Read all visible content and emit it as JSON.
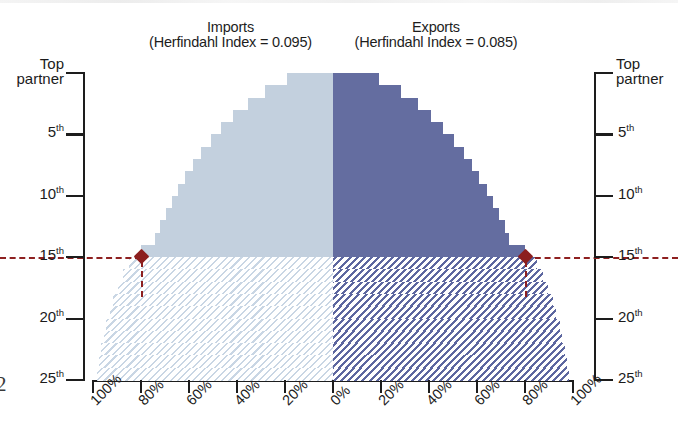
{
  "titles": {
    "imports_line1": "Imports",
    "imports_line2": "(Herfindahl Index = 0.095)",
    "exports_line1": "Exports",
    "exports_line2": "(Herfindahl Index = 0.085)"
  },
  "edge_artifact": "2",
  "axes": {
    "y_left_top_label_line1": "Top",
    "y_left_top_label_line2": "partner",
    "y_right_top_label_line1": "Top",
    "y_right_top_label_line2": "partner",
    "y_ticks": [
      {
        "label": "Top partner",
        "rank": 1
      },
      {
        "label": "5",
        "suffix": "th",
        "rank": 5
      },
      {
        "label": "10",
        "suffix": "th",
        "rank": 10
      },
      {
        "label": "15",
        "suffix": "th",
        "rank": 15
      },
      {
        "label": "20",
        "suffix": "th",
        "rank": 20
      },
      {
        "label": "25",
        "suffix": "th",
        "rank": 25
      }
    ],
    "x_left_ticks": [
      "100%",
      "80%",
      "60%",
      "40%",
      "20%",
      "0%"
    ],
    "x_right_ticks": [
      "0%",
      "20%",
      "40%",
      "60%",
      "80%",
      "100%"
    ]
  },
  "annotation": {
    "reference_rank": 15,
    "imports_cumulative_at_reference": "80%",
    "exports_cumulative_at_reference": "80%",
    "marker_color": "#8c1f1f"
  },
  "colors": {
    "imports_solid": "#c3d0de",
    "imports_hatch": "#c9d6e4",
    "exports_solid": "#646da0",
    "exports_hatch": "#5d67a0",
    "axis": "#1d1d1d",
    "background": "#ffffff"
  },
  "chart_data": {
    "type": "bar",
    "title": "",
    "subtitle": "",
    "orientation": "horizontal-back-to-back",
    "xlabel": "",
    "ylabel": "",
    "xlim": [
      -100,
      100
    ],
    "x_unit": "percent cumulative share",
    "grid": false,
    "legend_position": "top",
    "note": "Back-to-back cumulative trade-share chart. Left axis = imports (cumulative % read right-to-left from 0% at centre to 100% at far left); right axis = exports (cumulative % read left-to-right from 0% at centre to 100% at far right). Rows are trading-partner ranks 1 (Top partner) through 25. Rows 1-15 are drawn solid, rows 16-25 are drawn hatched (below the 15th-partner reference line).",
    "categories": [
      "Top partner",
      "2nd",
      "3rd",
      "4th",
      "5th",
      "6th",
      "7th",
      "8th",
      "9th",
      "10th",
      "11th",
      "12th",
      "13th",
      "14th",
      "15th",
      "16th",
      "17th",
      "18th",
      "19th",
      "20th",
      "21st",
      "22nd",
      "23rd",
      "24th",
      "25th"
    ],
    "series": [
      {
        "name": "Imports",
        "herfindahl_index": 0.095,
        "color": "#c3d0de",
        "units": "cumulative percent",
        "values": [
          19.0,
          28.5,
          35.5,
          41.5,
          46.5,
          51.0,
          55.0,
          58.5,
          61.5,
          64.5,
          67.0,
          69.5,
          72.0,
          74.0,
          80.0,
          85.0,
          87.5,
          89.5,
          91.5,
          93.0,
          94.5,
          95.5,
          96.5,
          97.5,
          98.5
        ]
      },
      {
        "name": "Exports",
        "herfindahl_index": 0.085,
        "color": "#646da0",
        "units": "cumulative percent",
        "values": [
          19.0,
          28.5,
          35.5,
          41.0,
          46.0,
          50.5,
          54.5,
          58.0,
          61.0,
          64.0,
          66.5,
          69.0,
          71.5,
          73.5,
          80.0,
          85.0,
          87.5,
          89.5,
          91.5,
          93.0,
          94.5,
          95.5,
          96.5,
          97.5,
          98.5
        ]
      }
    ],
    "reference_line": {
      "at_category": "15th",
      "imports_value": 80.0,
      "exports_value": 80.0,
      "style": "dashed",
      "color": "#8c1f1f"
    }
  }
}
